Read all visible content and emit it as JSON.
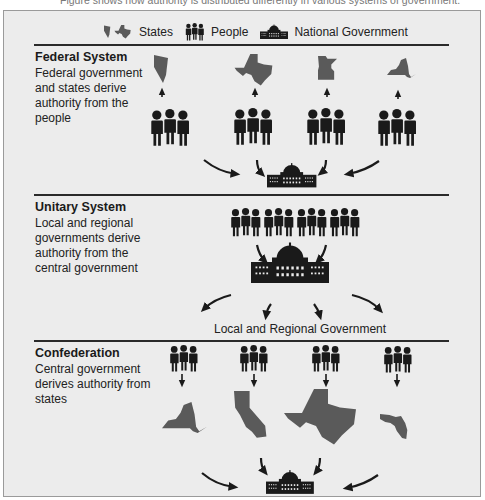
{
  "caption_partial": "Figure shows how authority is distributed differently in various systems of government.",
  "legend": {
    "states_label": "States",
    "people_label": "People",
    "national_label": "National Government"
  },
  "sections": [
    {
      "title": "Federal System",
      "description": [
        "Federal government",
        "and states derive",
        "authority from the",
        "people"
      ],
      "states": [
        "Nevada",
        "Texas",
        "Minnesota",
        "New York"
      ]
    },
    {
      "title": "Unitary System",
      "description": [
        "Local and regional",
        "governments derive",
        "authority from the",
        "central government"
      ],
      "bottom_label": "Local and Regional Government"
    },
    {
      "title": "Confederation",
      "description": [
        "Central government",
        "derives authority from",
        "states"
      ],
      "states": [
        "New York",
        "California",
        "Texas",
        "Florida"
      ]
    }
  ],
  "colors": {
    "background": "#ececec",
    "state_fill": "#5a5a5a",
    "icon_fill": "#1a1a1a",
    "divider": "#2a2a2a"
  }
}
